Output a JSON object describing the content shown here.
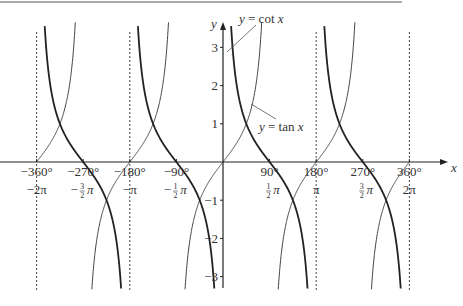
{
  "chart_data": {
    "type": "line",
    "title": "",
    "xlabel": "x",
    "ylabel": "y",
    "xlim_deg": [
      -360,
      360
    ],
    "ylim": [
      -3.3,
      3.3
    ],
    "grid": false,
    "x_ticks": [
      {
        "deg": -360,
        "deg_label": "−360°",
        "rad_label": "−2π"
      },
      {
        "deg": -270,
        "deg_label": "−270°",
        "rad_label": "−3/2 π"
      },
      {
        "deg": -180,
        "deg_label": "−180°",
        "rad_label": "−π"
      },
      {
        "deg": -90,
        "deg_label": "−90°",
        "rad_label": "−1/2 π"
      },
      {
        "deg": 90,
        "deg_label": "90°",
        "rad_label": "1/2 π"
      },
      {
        "deg": 180,
        "deg_label": "180°",
        "rad_label": "π"
      },
      {
        "deg": 270,
        "deg_label": "270°",
        "rad_label": "3/2 π"
      },
      {
        "deg": 360,
        "deg_label": "360°",
        "rad_label": "2π"
      }
    ],
    "y_ticks": [
      3,
      2,
      1,
      -1,
      -2,
      -3
    ],
    "y_tick_labels": [
      "3",
      "2",
      "1",
      "−1",
      "−2",
      "−3"
    ],
    "asymptotes_deg": [
      -360,
      -180,
      180,
      360
    ],
    "series": [
      {
        "name": "y = tan x",
        "function": "tan",
        "style": "thin",
        "annotation": "y = tan x"
      },
      {
        "name": "y = cot x",
        "function": "cot",
        "style": "thick",
        "annotation": "y = cot x"
      }
    ],
    "intersections": [
      {
        "deg": -315,
        "y": 1
      },
      {
        "deg": -225,
        "y": -1
      },
      {
        "deg": -135,
        "y": 1
      },
      {
        "deg": -45,
        "y": -1
      },
      {
        "deg": 45,
        "y": 1
      },
      {
        "deg": 135,
        "y": -1
      },
      {
        "deg": 225,
        "y": 1
      },
      {
        "deg": 315,
        "y": -1
      }
    ]
  },
  "labels": {
    "x_axis": "x",
    "y_axis": "y",
    "cot_annotation": "y = cot x",
    "tan_annotation": "y = tan x"
  }
}
